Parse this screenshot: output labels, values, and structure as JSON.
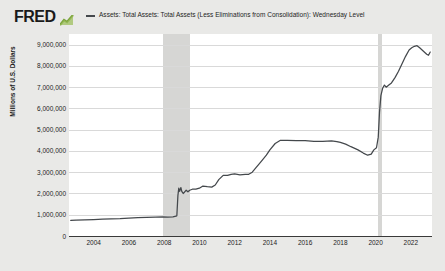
{
  "brand": {
    "logo_text": "FRED",
    "logo_icon": "green-chart-icon"
  },
  "legend": {
    "items": [
      {
        "label": "Assets: Total Assets: Total Assets (Less Eliminations from Consolidation): Wednesday Level",
        "color": "#44484c"
      }
    ]
  },
  "chart_data": {
    "type": "line",
    "title": "",
    "subtitle": "",
    "xlabel": "",
    "ylabel": "Millions of U.S. Dollars",
    "xlim": [
      2002.6,
      2023.2
    ],
    "ylim": [
      0,
      9500000
    ],
    "grid": true,
    "legend_position": "top",
    "y_ticks": [
      0,
      1000000,
      2000000,
      3000000,
      4000000,
      5000000,
      6000000,
      7000000,
      8000000,
      9000000
    ],
    "y_tick_labels": [
      "0",
      "1,000,000",
      "2,000,000",
      "3,000,000",
      "4,000,000",
      "5,000,000",
      "6,000,000",
      "7,000,000",
      "8,000,000",
      "9,000,000"
    ],
    "x_ticks": [
      2004,
      2006,
      2008,
      2010,
      2012,
      2014,
      2016,
      2018,
      2020,
      2022
    ],
    "x_tick_labels": [
      "2004",
      "2006",
      "2008",
      "2010",
      "2012",
      "2014",
      "2016",
      "2018",
      "2020",
      "2022"
    ],
    "recession_bands": [
      {
        "start": 2007.95,
        "end": 2009.45,
        "color": "#d6d6d4"
      },
      {
        "start": 2020.15,
        "end": 2020.35,
        "color": "#d6d6d4"
      }
    ],
    "series": [
      {
        "name": "Assets: Total Assets: Total Assets (Less Eliminations from Consolidation): Wednesday Level",
        "color": "#44484c",
        "x": [
          2002.7,
          2003.0,
          2003.5,
          2004.0,
          2004.5,
          2005.0,
          2005.5,
          2006.0,
          2006.5,
          2007.0,
          2007.5,
          2007.9,
          2008.2,
          2008.5,
          2008.72,
          2008.78,
          2008.83,
          2008.88,
          2008.95,
          2009.0,
          2009.08,
          2009.15,
          2009.25,
          2009.35,
          2009.45,
          2009.6,
          2009.8,
          2010.0,
          2010.2,
          2010.45,
          2010.7,
          2010.9,
          2011.1,
          2011.35,
          2011.6,
          2011.8,
          2012.0,
          2012.3,
          2012.6,
          2012.8,
          2013.0,
          2013.2,
          2013.5,
          2013.8,
          2014.0,
          2014.3,
          2014.6,
          2014.85,
          2015.0,
          2015.5,
          2016.0,
          2016.5,
          2017.0,
          2017.5,
          2017.8,
          2018.0,
          2018.3,
          2018.6,
          2019.0,
          2019.3,
          2019.55,
          2019.75,
          2019.9,
          2020.05,
          2020.15,
          2020.22,
          2020.3,
          2020.4,
          2020.5,
          2020.6,
          2020.75,
          2020.9,
          2021.1,
          2021.3,
          2021.5,
          2021.7,
          2021.9,
          2022.05,
          2022.2,
          2022.35,
          2022.5,
          2022.7,
          2022.9,
          2023.0,
          2023.1
        ],
        "y": [
          730000,
          745000,
          760000,
          775000,
          790000,
          805000,
          820000,
          845000,
          860000,
          875000,
          890000,
          900000,
          890000,
          900000,
          950000,
          1900000,
          2250000,
          2100000,
          2280000,
          2100000,
          2000000,
          2060000,
          2150000,
          2080000,
          2150000,
          2200000,
          2200000,
          2250000,
          2350000,
          2320000,
          2300000,
          2400000,
          2650000,
          2850000,
          2850000,
          2900000,
          2920000,
          2880000,
          2900000,
          2900000,
          3000000,
          3200000,
          3500000,
          3800000,
          4050000,
          4350000,
          4500000,
          4500000,
          4500000,
          4480000,
          4480000,
          4450000,
          4450000,
          4470000,
          4440000,
          4400000,
          4320000,
          4200000,
          4050000,
          3900000,
          3800000,
          3850000,
          4050000,
          4150000,
          4650000,
          5800000,
          6600000,
          6950000,
          7100000,
          7000000,
          7100000,
          7200000,
          7450000,
          7750000,
          8100000,
          8450000,
          8750000,
          8850000,
          8920000,
          8950000,
          8850000,
          8700000,
          8550000,
          8500000,
          8650000
        ]
      }
    ]
  }
}
